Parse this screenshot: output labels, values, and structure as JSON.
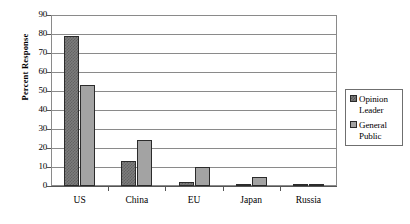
{
  "chart_data": {
    "type": "bar",
    "title": "",
    "xlabel": "",
    "ylabel": "Percent Response",
    "ylim": [
      0,
      90
    ],
    "ytick_step": 10,
    "yticks": [
      90,
      80,
      70,
      60,
      50,
      40,
      30,
      20,
      10,
      0
    ],
    "grid": true,
    "legend_position": "right",
    "categories": [
      "US",
      "China",
      "EU",
      "Japan",
      "Russia"
    ],
    "series": [
      {
        "name": "Opinion Leader",
        "values": [
          79,
          13,
          2,
          1,
          1
        ],
        "color": "#7d7d7d",
        "fill": "checkered"
      },
      {
        "name": "General Public",
        "values": [
          53,
          24,
          10,
          5,
          1
        ],
        "color": "#a3a3a3",
        "fill": "solid"
      }
    ]
  },
  "legend": {
    "entries": [
      {
        "label_line1": "Opinion",
        "label_line2": "Leader"
      },
      {
        "label_line1": "General",
        "label_line2": "Public"
      }
    ]
  },
  "colors": {
    "series_0": "#7d7d7d",
    "series_1": "#a3a3a3",
    "grid": "#8a8a8a",
    "axis": "#555555",
    "bar_border": "#2b2b2b",
    "background": "#ffffff"
  }
}
